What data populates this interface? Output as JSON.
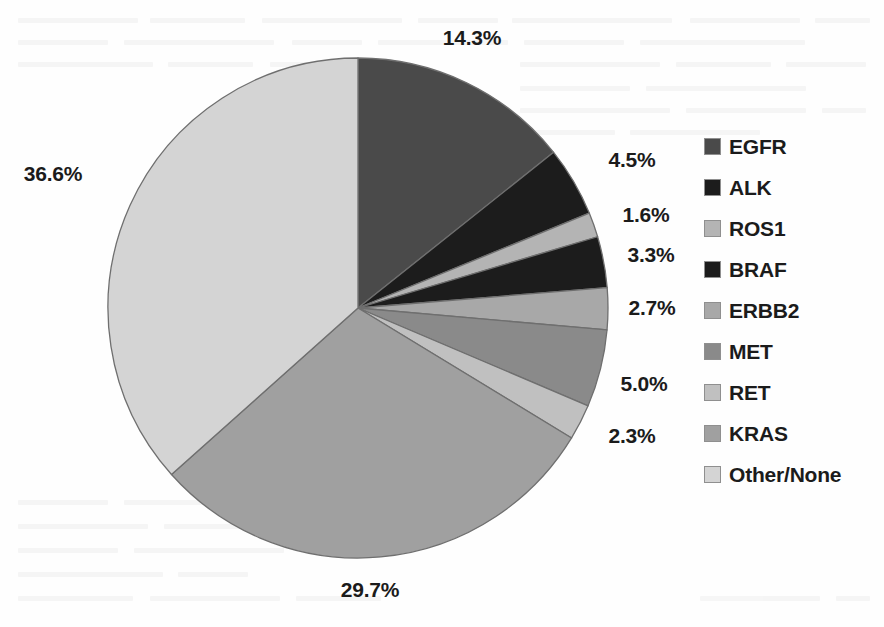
{
  "chart_data": {
    "type": "pie",
    "title": "",
    "subtitle": "",
    "xlabel": "",
    "ylabel": "",
    "grid": false,
    "legend_position": "right",
    "start_angle_deg": 0,
    "direction": "clockwise",
    "units": "percent",
    "total": 100.0,
    "categories": [
      "EGFR",
      "ALK",
      "ROS1",
      "BRAF",
      "ERBB2",
      "MET",
      "RET",
      "KRAS",
      "Other/None"
    ],
    "values": [
      14.3,
      4.5,
      1.6,
      3.3,
      2.7,
      5.0,
      2.3,
      29.7,
      36.6
    ],
    "data_labels": [
      "14.3%",
      "4.5%",
      "1.6%",
      "3.3%",
      "2.7%",
      "5.0%",
      "2.3%",
      "29.7%",
      "36.6%"
    ],
    "slice_colors": [
      "#4a4a4a",
      "#1c1c1c",
      "#b4b4b4",
      "#1c1c1c",
      "#a8a8a8",
      "#8a8a8a",
      "#c0c0c0",
      "#a0a0a0",
      "#d4d4d4"
    ],
    "slices": [
      {
        "label": "EGFR",
        "value": 14.3,
        "data_label": "14.3%",
        "color": "#4a4a4a"
      },
      {
        "label": "ALK",
        "value": 4.5,
        "data_label": "4.5%",
        "color": "#1c1c1c"
      },
      {
        "label": "ROS1",
        "value": 1.6,
        "data_label": "1.6%",
        "color": "#b4b4b4"
      },
      {
        "label": "BRAF",
        "value": 3.3,
        "data_label": "3.3%",
        "color": "#1c1c1c"
      },
      {
        "label": "ERBB2",
        "value": 2.7,
        "data_label": "2.7%",
        "color": "#a8a8a8"
      },
      {
        "label": "MET",
        "value": 5.0,
        "data_label": "5.0%",
        "color": "#8a8a8a"
      },
      {
        "label": "RET",
        "value": 2.3,
        "data_label": "2.3%",
        "color": "#c0c0c0"
      },
      {
        "label": "KRAS",
        "value": 29.7,
        "data_label": "29.7%",
        "color": "#a0a0a0"
      },
      {
        "label": "Other/None",
        "value": 36.6,
        "data_label": "36.6%",
        "color": "#d4d4d4"
      }
    ]
  },
  "legend": {
    "items": [
      {
        "label": "EGFR",
        "color": "#4a4a4a"
      },
      {
        "label": "ALK",
        "color": "#1c1c1c"
      },
      {
        "label": "ROS1",
        "color": "#b4b4b4"
      },
      {
        "label": "BRAF",
        "color": "#1c1c1c"
      },
      {
        "label": "ERBB2",
        "color": "#a8a8a8"
      },
      {
        "label": "MET",
        "color": "#8a8a8a"
      },
      {
        "label": "RET",
        "color": "#c0c0c0"
      },
      {
        "label": "KRAS",
        "color": "#a0a0a0"
      },
      {
        "label": "Other/None",
        "color": "#d4d4d4"
      }
    ]
  },
  "callouts": [
    {
      "text": "14.3%",
      "x": 472,
      "y": 26,
      "align": "center"
    },
    {
      "text": "4.5%",
      "x": 632,
      "y": 148,
      "align": "center"
    },
    {
      "text": "1.6%",
      "x": 646,
      "y": 203,
      "align": "center"
    },
    {
      "text": "3.3%",
      "x": 651,
      "y": 243,
      "align": "center"
    },
    {
      "text": "2.7%",
      "x": 652,
      "y": 296,
      "align": "center"
    },
    {
      "text": "5.0%",
      "x": 644,
      "y": 372,
      "align": "center"
    },
    {
      "text": "2.3%",
      "x": 632,
      "y": 424,
      "align": "center"
    },
    {
      "text": "29.7%",
      "x": 370,
      "y": 578,
      "align": "center"
    },
    {
      "text": "36.6%",
      "x": 53,
      "y": 162,
      "align": "center"
    }
  ],
  "geometry": {
    "center_x": 358,
    "center_y": 308,
    "radius": 250,
    "outline_color": "#6f6f6f"
  },
  "colors": {
    "background": "#fefefe",
    "text": "#1b1b1b",
    "slice_outline": "#6f6f6f"
  }
}
